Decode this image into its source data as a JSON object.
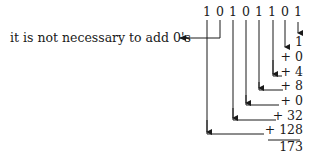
{
  "binary_number": "10101101",
  "digits": [
    "1",
    "0",
    "1",
    "0",
    "1",
    "1",
    "0",
    "1"
  ],
  "note": "it is not necessary to add 0's",
  "addends": [
    "1",
    "+ 0",
    "+ 4",
    "+ 8",
    "+ 0",
    "+ 32",
    "+ 128"
  ],
  "total": "173",
  "colors": {
    "ink": "#1a1a1a",
    "background": "#ffffff"
  }
}
